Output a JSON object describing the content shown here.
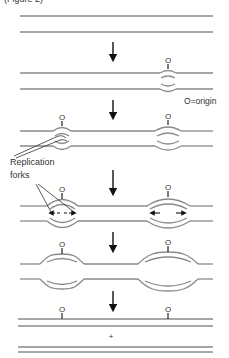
{
  "figure": {
    "title": "(Figure 2)",
    "labels": {
      "origin_legend": "O=origin",
      "replication_line1": "Replication",
      "replication_line2": "forks",
      "origin_marker": "O",
      "plus": "+"
    },
    "stages": [
      {
        "name": "unreplicated DNA",
        "origins": []
      },
      {
        "name": "origin opening",
        "origins": [
          "right"
        ]
      },
      {
        "name": "two bubbles forming",
        "origins": [
          "left",
          "right"
        ]
      },
      {
        "name": "bidirectional fork movement",
        "origins": [
          "left",
          "right"
        ]
      },
      {
        "name": "bubbles enlarging",
        "origins": [
          "left",
          "right"
        ]
      },
      {
        "name": "two daughter duplexes",
        "origins": [
          "left",
          "right"
        ]
      }
    ],
    "colors": {
      "strand": "#8a8a8a",
      "newstrand": "#555555",
      "arrow": "#111111",
      "text": "#333333"
    }
  }
}
